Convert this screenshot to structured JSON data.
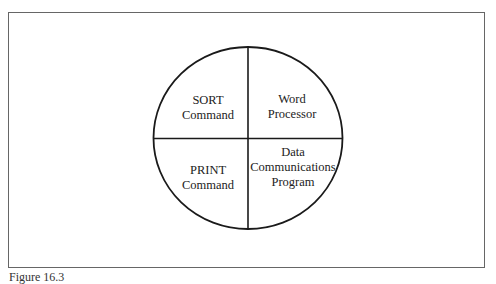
{
  "figure": {
    "caption": "Figure 16.3",
    "quadrants": [
      {
        "position": "top-left",
        "lines": [
          "SORT",
          "Command"
        ]
      },
      {
        "position": "top-right",
        "lines": [
          "Word",
          "Processor"
        ]
      },
      {
        "position": "bottom-left",
        "lines": [
          "PRINT",
          "Command"
        ]
      },
      {
        "position": "bottom-right",
        "lines": [
          "Data",
          "Communications",
          "Program"
        ]
      }
    ],
    "colors": {
      "stroke": "#1a1a1a",
      "frame": "#666666",
      "text": "#222222"
    }
  }
}
